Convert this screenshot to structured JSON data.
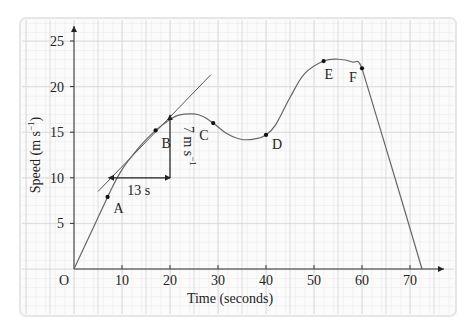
{
  "chart_data": {
    "type": "line",
    "title": "",
    "xlabel": "Time (seconds)",
    "ylabel": "Speed (m s",
    "ylabel_sup": "−1",
    "origin_label": "O",
    "xlim": [
      0,
      75
    ],
    "ylim": [
      0,
      26
    ],
    "xticks": [
      10,
      20,
      30,
      40,
      50,
      60,
      70
    ],
    "yticks": [
      5,
      10,
      15,
      20,
      25
    ],
    "grid": true,
    "legend": null,
    "series": [
      {
        "name": "speed-time curve",
        "x": [
          0,
          7,
          10,
          14,
          17,
          20,
          22,
          25,
          27,
          29,
          32,
          35,
          38,
          40,
          42,
          45,
          48,
          52,
          55,
          58,
          60,
          64,
          68,
          72.5
        ],
        "y": [
          0,
          7.9,
          10.9,
          13.6,
          15.2,
          16.4,
          16.9,
          17,
          16.7,
          16,
          14.8,
          14.2,
          14.3,
          14.7,
          15.8,
          18.8,
          21.4,
          22.8,
          23,
          22.7,
          22,
          15,
          8,
          0
        ]
      }
    ],
    "points": [
      {
        "label": "A",
        "x": 7,
        "y": 7.9
      },
      {
        "label": "B",
        "x": 17,
        "y": 15.2
      },
      {
        "label": "C",
        "x": 29,
        "y": 16
      },
      {
        "label": "D",
        "x": 40,
        "y": 14.7
      },
      {
        "label": "E",
        "x": 52,
        "y": 22.8
      },
      {
        "label": "F",
        "x": 60,
        "y": 22
      }
    ],
    "annotations": {
      "tangent_at": "B",
      "tangent_line": {
        "x1": 5,
        "y1": 8.5,
        "x2": 28.5,
        "y2": 21.3
      },
      "run_label": "13 s",
      "rise_label": "7 m s",
      "rise_label_sup": "−1",
      "run": {
        "x1": 7,
        "x2": 20,
        "y": 10
      },
      "rise": {
        "x": 20,
        "y1": 10,
        "y2": 17
      }
    }
  }
}
